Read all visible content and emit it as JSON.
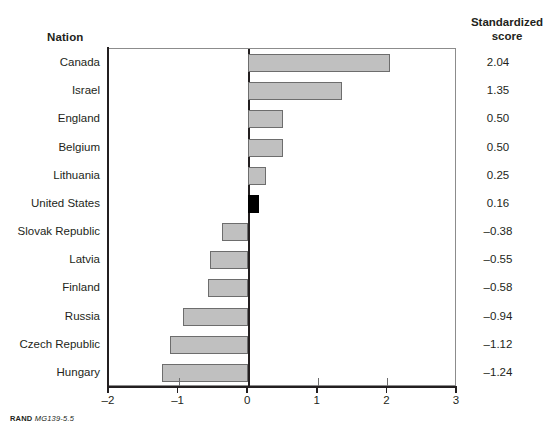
{
  "headers": {
    "nation": "Nation",
    "score_line1": "Standardized",
    "score_line2": "score"
  },
  "source_note": {
    "publisher": "RAND",
    "code": "MG139-5.5"
  },
  "colors": {
    "bar_fill": "#c0c0c0",
    "bar_border": "#6d6d6d",
    "highlight_fill": "#000000",
    "axis": "#231f20",
    "frame": "#8c8c8c",
    "background": "#ffffff"
  },
  "chart_data": {
    "type": "bar",
    "orientation": "horizontal",
    "title": "",
    "subtitle": "",
    "xlabel": "",
    "ylabel": "Nation",
    "xlim": [
      -2,
      3
    ],
    "xticks": [
      -2,
      -1,
      0,
      1,
      2,
      3
    ],
    "xtick_labels": [
      "–2",
      "–1",
      "0",
      "1",
      "2",
      "3"
    ],
    "grid": false,
    "legend": null,
    "value_label_header": "Standardized score",
    "categories": [
      "Canada",
      "Israel",
      "England",
      "Belgium",
      "Lithuania",
      "United States",
      "Slovak Republic",
      "Latvia",
      "Finland",
      "Russia",
      "Czech Republic",
      "Hungary"
    ],
    "values": [
      2.04,
      1.35,
      0.5,
      0.5,
      0.25,
      0.16,
      -0.38,
      -0.55,
      -0.58,
      -0.94,
      -1.12,
      -1.24
    ],
    "value_labels": [
      "2.04",
      "1.35",
      "0.50",
      "0.50",
      "0.25",
      "0.16",
      "–0.38",
      "–0.55",
      "–0.58",
      "–0.94",
      "–1.12",
      "–1.24"
    ],
    "highlighted_category": "United States"
  }
}
